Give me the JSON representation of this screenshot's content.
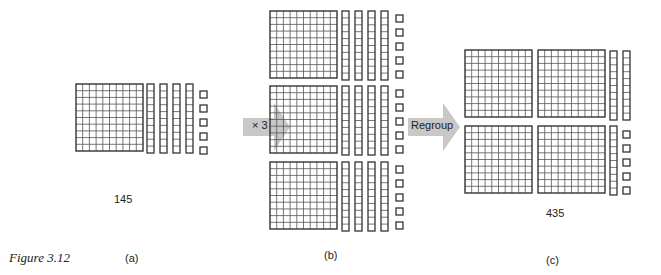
{
  "figure": {
    "caption": "Figure 3.12",
    "panels": [
      {
        "id": "a",
        "label": "(a)",
        "value_label": "145",
        "hundreds": 1,
        "tens": 4,
        "ones": 5
      },
      {
        "id": "b",
        "label": "(b)",
        "value_label": "",
        "hundreds": 3,
        "tens": 12,
        "ones": 15
      },
      {
        "id": "c",
        "label": "(c)",
        "value_label": "435",
        "hundreds": 4,
        "tens": 3,
        "ones": 5
      }
    ],
    "arrows": [
      {
        "label": "× 3",
        "fill": "#c8c8c8"
      },
      {
        "label": "Regroup",
        "fill": "#c8c8c8"
      }
    ],
    "colors": {
      "line": "#333333",
      "grid": "#555555",
      "arrow": "#c8c8c8",
      "text": "#222222"
    }
  }
}
